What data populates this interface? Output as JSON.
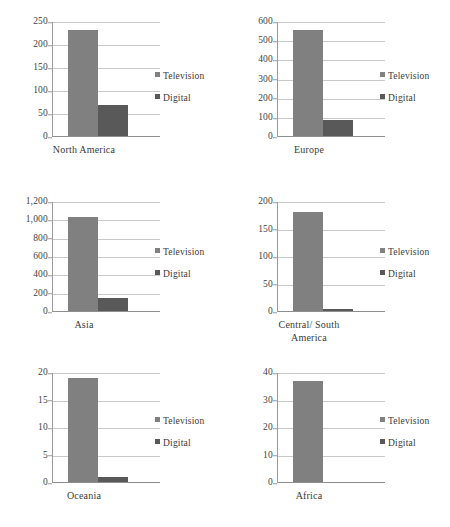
{
  "legend": {
    "television_label": "Television",
    "digital_label": "Digital",
    "television_color": "#808080",
    "digital_color": "#595959"
  },
  "chart_data": {
    "type": "bar",
    "title": "",
    "xlabel": "",
    "ylabel": "",
    "grid": true,
    "legend_position": "right",
    "series_names": [
      "Television",
      "Digital"
    ],
    "series_colors": [
      "#808080",
      "#595959"
    ],
    "panels": [
      {
        "category": "North America",
        "category_lines": [
          "North America"
        ],
        "values": {
          "Television": 232,
          "Digital": 67
        },
        "ylim": [
          0,
          250
        ],
        "ystep": 50,
        "yticks": [
          "250",
          "200",
          "150",
          "100",
          "50",
          "0"
        ],
        "ytick_values": [
          250,
          200,
          150,
          100,
          50,
          0
        ]
      },
      {
        "category": "Europe",
        "category_lines": [
          "Europe"
        ],
        "values": {
          "Television": 558,
          "Digital": 85
        },
        "ylim": [
          0,
          600
        ],
        "ystep": 100,
        "yticks": [
          "600",
          "500",
          "400",
          "300",
          "200",
          "100",
          "0"
        ],
        "ytick_values": [
          600,
          500,
          400,
          300,
          200,
          100,
          0
        ]
      },
      {
        "category": "Asia",
        "category_lines": [
          "Asia"
        ],
        "values": {
          "Television": 1030,
          "Digital": 145
        },
        "ylim": [
          0,
          1200
        ],
        "ystep": 200,
        "yticks": [
          "1,200",
          "1,000",
          "800",
          "600",
          "400",
          "200",
          "0"
        ],
        "ytick_values": [
          1200,
          1000,
          800,
          600,
          400,
          200,
          0
        ]
      },
      {
        "category": "Central/ South America",
        "category_lines": [
          "Central/ South",
          "America"
        ],
        "values": {
          "Television": 181,
          "Digital": 3
        },
        "ylim": [
          0,
          200
        ],
        "ystep": 50,
        "yticks": [
          "200",
          "150",
          "100",
          "50",
          "0"
        ],
        "ytick_values": [
          200,
          150,
          100,
          50,
          0
        ]
      },
      {
        "category": "Oceania",
        "category_lines": [
          "Oceania"
        ],
        "values": {
          "Television": 19,
          "Digital": 1
        },
        "ylim": [
          0,
          20
        ],
        "ystep": 5,
        "yticks": [
          "20",
          "15",
          "10",
          "5",
          "0"
        ],
        "ytick_values": [
          20,
          15,
          10,
          5,
          0
        ]
      },
      {
        "category": "Africa",
        "category_lines": [
          "Africa"
        ],
        "values": {
          "Television": 37,
          "Digital": 0
        },
        "ylim": [
          0,
          40
        ],
        "ystep": 10,
        "yticks": [
          "40",
          "30",
          "20",
          "10",
          "0"
        ],
        "ytick_values": [
          40,
          30,
          20,
          10,
          0
        ]
      }
    ]
  }
}
